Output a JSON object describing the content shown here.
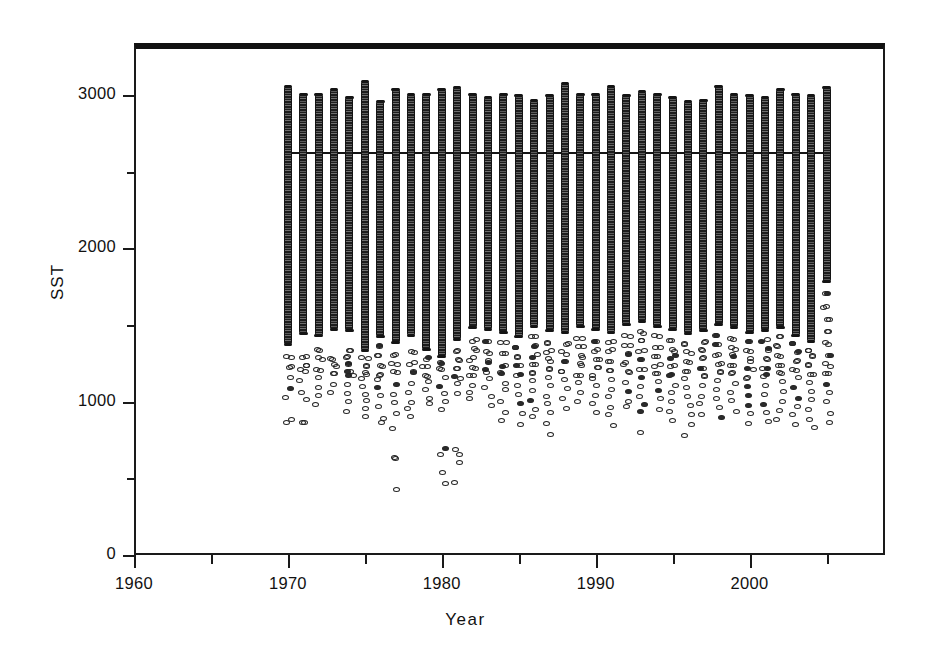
{
  "figure": {
    "width": 931,
    "height": 653,
    "background": "#ffffff",
    "frame_color": "#1a1a1a",
    "marker_color": "#242424",
    "trend_color": "#161616"
  },
  "axes": {
    "x": {
      "label": "Year",
      "major_ticks": [
        1960,
        1970,
        1980,
        1990,
        2000
      ],
      "major_tick_labels": [
        "1960",
        "1970",
        "1980",
        "1990",
        "2000"
      ],
      "minor_ticks": [
        1965,
        1975,
        1985,
        1995,
        2005
      ],
      "limits": [
        1960,
        2008.8
      ],
      "pixel_left": 134,
      "pixel_right": 885
    },
    "y": {
      "label": "SST",
      "major_ticks": [
        0,
        1000,
        2000,
        3000
      ],
      "major_tick_labels": [
        "0",
        "1000",
        "2000",
        "3000"
      ],
      "minor_ticks": [
        500,
        1500,
        2500
      ],
      "limits": [
        0,
        3340
      ],
      "pixel_bottom": 555,
      "pixel_top": 43
    },
    "grid": "off",
    "legend": "none"
  },
  "chart_data": {
    "type": "scatter",
    "title": "",
    "subtitle": "",
    "xlabel": "Year",
    "ylabel": "SST",
    "xlim": [
      1960,
      2008.8
    ],
    "ylim": [
      0,
      3340
    ],
    "xticks": [
      1960,
      1970,
      1980,
      1990,
      2000
    ],
    "yticks": [
      0,
      1000,
      2000,
      3000
    ],
    "xminor": [
      1965,
      1975,
      1985,
      1995,
      2005
    ],
    "yminor": [
      500,
      1500,
      2500
    ],
    "grid": false,
    "legend_position": "none",
    "marker_style": "open-circle",
    "annotations": [
      {
        "type": "horizontal-line",
        "y": 2630,
        "x_start": 1970,
        "x_end": 2005,
        "label": ""
      }
    ],
    "series": [
      {
        "name": "SST observations",
        "marker": "open-circle",
        "years": [
          {
            "year": 1970,
            "n": 220,
            "dense_min": 1370,
            "dense_max": 3060,
            "outliers": [
              1290,
              1230,
              1150,
              1080,
              1030,
              880,
              860
            ]
          },
          {
            "year": 1971,
            "n": 215,
            "dense_min": 1440,
            "dense_max": 3010,
            "outliers": [
              1300,
              1240,
              1200,
              1130,
              1060,
              1010,
              870,
              855
            ]
          },
          {
            "year": 1972,
            "n": 210,
            "dense_min": 1430,
            "dense_max": 3010,
            "outliers": [
              1340,
              1280,
              1210,
              1150,
              1100,
              1030,
              980
            ]
          },
          {
            "year": 1973,
            "n": 214,
            "dense_min": 1470,
            "dense_max": 3040,
            "outliers": [
              1270,
              1230,
              1180,
              1120,
              1060
            ]
          },
          {
            "year": 1974,
            "n": 205,
            "dense_min": 1460,
            "dense_max": 2990,
            "outliers": [
              1340,
              1290,
              1250,
              1200,
              1170,
              1120,
              1050,
              990,
              930
            ]
          },
          {
            "year": 1975,
            "n": 212,
            "dense_min": 1330,
            "dense_max": 3090,
            "outliers": [
              1280,
              1240,
              1190,
              1150,
              1100,
              1040,
              1000,
              960,
              900
            ]
          },
          {
            "year": 1976,
            "n": 198,
            "dense_min": 1420,
            "dense_max": 2960,
            "outliers": [
              1360,
              1300,
              1230,
              1180,
              1140,
              1100,
              1050,
              970,
              900,
              860
            ]
          },
          {
            "year": 1977,
            "n": 206,
            "dense_min": 1380,
            "dense_max": 3040,
            "outliers": [
              1300,
              1240,
              1190,
              1120,
              1050,
              990,
              920,
              830,
              640,
              630,
              420
            ]
          },
          {
            "year": 1978,
            "n": 204,
            "dense_min": 1430,
            "dense_max": 3010,
            "outliers": [
              1320,
              1250,
              1190,
              1120,
              1060,
              1000,
              950,
              900
            ]
          },
          {
            "year": 1979,
            "n": 210,
            "dense_min": 1340,
            "dense_max": 3010,
            "outliers": [
              1280,
              1230,
              1170,
              1130,
              1080,
              1030,
              980
            ]
          },
          {
            "year": 1980,
            "n": 208,
            "dense_min": 1290,
            "dense_max": 3040,
            "outliers": [
              1250,
              1210,
              1150,
              1100,
              1060,
              1010,
              960,
              700,
              660,
              540,
              460
            ]
          },
          {
            "year": 1981,
            "n": 200,
            "dense_min": 1400,
            "dense_max": 3050,
            "outliers": [
              1330,
              1270,
              1220,
              1160,
              1110,
              1050,
              690,
              650,
              600,
              470
            ]
          },
          {
            "year": 1982,
            "n": 202,
            "dense_min": 1480,
            "dense_max": 3010,
            "outliers": [
              1400,
              1340,
              1280,
              1220,
              1170,
              1110,
              1060,
              1010
            ]
          },
          {
            "year": 1983,
            "n": 197,
            "dense_min": 1470,
            "dense_max": 2990,
            "outliers": [
              1390,
              1320,
              1260,
              1200,
              1150,
              1090,
              1030,
              980
            ]
          },
          {
            "year": 1984,
            "n": 199,
            "dense_min": 1450,
            "dense_max": 3010,
            "outliers": [
              1380,
              1310,
              1240,
              1180,
              1120,
              1070,
              1010,
              940,
              880
            ]
          },
          {
            "year": 1985,
            "n": 203,
            "dense_min": 1420,
            "dense_max": 3000,
            "outliers": [
              1350,
              1290,
              1230,
              1170,
              1110,
              1050,
              990,
              930,
              860
            ]
          },
          {
            "year": 1986,
            "n": 196,
            "dense_min": 1490,
            "dense_max": 2970,
            "outliers": [
              1420,
              1360,
              1300,
              1250,
              1190,
              1130,
              1070,
              1000,
              950,
              900
            ]
          },
          {
            "year": 1987,
            "n": 201,
            "dense_min": 1460,
            "dense_max": 3000,
            "outliers": [
              1390,
              1330,
              1270,
              1210,
              1150,
              1100,
              1040,
              980,
              930,
              860,
              780
            ]
          },
          {
            "year": 1988,
            "n": 205,
            "dense_min": 1450,
            "dense_max": 3080,
            "outliers": [
              1380,
              1320,
              1260,
              1200,
              1140,
              1080,
              1020,
              960
            ]
          },
          {
            "year": 1989,
            "n": 198,
            "dense_min": 1490,
            "dense_max": 3010,
            "outliers": [
              1420,
              1360,
              1300,
              1240,
              1180,
              1120,
              1060,
              1000
            ]
          },
          {
            "year": 1990,
            "n": 200,
            "dense_min": 1470,
            "dense_max": 3010,
            "outliers": [
              1400,
              1340,
              1280,
              1220,
              1160,
              1100,
              1040,
              980,
              930
            ]
          },
          {
            "year": 1991,
            "n": 204,
            "dense_min": 1450,
            "dense_max": 3060,
            "outliers": [
              1390,
              1330,
              1270,
              1210,
              1150,
              1090,
              1030,
              970,
              910,
              850
            ]
          },
          {
            "year": 1992,
            "n": 197,
            "dense_min": 1500,
            "dense_max": 3000,
            "outliers": [
              1430,
              1370,
              1310,
              1250,
              1190,
              1130,
              1070,
              1010,
              960
            ]
          },
          {
            "year": 1993,
            "n": 202,
            "dense_min": 1520,
            "dense_max": 3030,
            "outliers": [
              1450,
              1390,
              1330,
              1270,
              1210,
              1150,
              1100,
              1040,
              980,
              930,
              790
            ]
          },
          {
            "year": 1994,
            "n": 199,
            "dense_min": 1490,
            "dense_max": 3010,
            "outliers": [
              1420,
              1360,
              1300,
              1240,
              1190,
              1130,
              1070,
              1010,
              950
            ]
          },
          {
            "year": 1995,
            "n": 196,
            "dense_min": 1470,
            "dense_max": 2990,
            "outliers": [
              1400,
              1340,
              1290,
              1230,
              1170,
              1110,
              1060,
              1000,
              940,
              880
            ]
          },
          {
            "year": 1996,
            "n": 193,
            "dense_min": 1440,
            "dense_max": 2960,
            "outliers": [
              1380,
              1320,
              1260,
              1200,
              1150,
              1090,
              1030,
              970,
              910,
              850,
              780
            ]
          },
          {
            "year": 1997,
            "n": 195,
            "dense_min": 1460,
            "dense_max": 2970,
            "outliers": [
              1390,
              1330,
              1280,
              1220,
              1160,
              1100,
              1040,
              980,
              920
            ]
          },
          {
            "year": 1998,
            "n": 206,
            "dense_min": 1500,
            "dense_max": 3060,
            "outliers": [
              1430,
              1370,
              1310,
              1250,
              1200,
              1140,
              1080,
              1020,
              960,
              900
            ]
          },
          {
            "year": 1999,
            "n": 201,
            "dense_min": 1480,
            "dense_max": 3010,
            "outliers": [
              1410,
              1350,
              1300,
              1240,
              1180,
              1120,
              1060,
              1000,
              940
            ]
          },
          {
            "year": 2000,
            "n": 198,
            "dense_min": 1450,
            "dense_max": 3000,
            "outliers": [
              1390,
              1330,
              1270,
              1210,
              1160,
              1100,
              1040,
              980,
              920,
              860
            ]
          },
          {
            "year": 2001,
            "n": 196,
            "dense_min": 1460,
            "dense_max": 2990,
            "outliers": [
              1400,
              1340,
              1280,
              1220,
              1170,
              1110,
              1050,
              990,
              930,
              870
            ]
          },
          {
            "year": 2002,
            "n": 202,
            "dense_min": 1480,
            "dense_max": 3040,
            "outliers": [
              1420,
              1360,
              1300,
              1240,
              1190,
              1130,
              1070,
              1010,
              950,
              890
            ]
          },
          {
            "year": 2003,
            "n": 199,
            "dense_min": 1430,
            "dense_max": 3010,
            "outliers": [
              1380,
              1320,
              1260,
              1210,
              1150,
              1090,
              1030,
              970,
              910,
              850
            ]
          },
          {
            "year": 2004,
            "n": 197,
            "dense_min": 1390,
            "dense_max": 3000,
            "outliers": [
              1340,
              1290,
              1230,
              1180,
              1120,
              1070,
              1010,
              950,
              890,
              840
            ]
          },
          {
            "year": 2005,
            "n": 194,
            "dense_min": 1780,
            "dense_max": 3050,
            "outliers": [
              1700,
              1620,
              1540,
              1450,
              1380,
              1300,
              1240,
              1180,
              1120,
              1060,
              1000,
              930,
              870
            ]
          }
        ]
      }
    ]
  }
}
